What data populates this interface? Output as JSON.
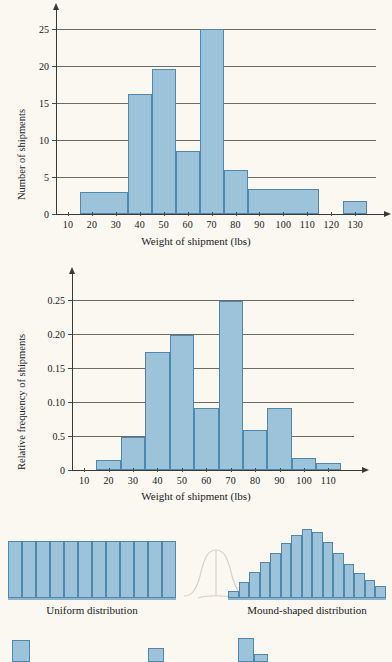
{
  "page": {
    "background_color": "#faf8f1",
    "bar_fill_color": "#9dc3da",
    "bar_stroke_color": "#4e88ac",
    "grid_color": "#6b6b63",
    "axis_color": "#3a3a34"
  },
  "chart_data": [
    {
      "id": "frequency-histogram",
      "type": "bar",
      "title": "",
      "xlabel": "Weight of shipment (lbs)",
      "ylabel": "Number of shipments",
      "xlim": [
        5,
        137
      ],
      "ylim": [
        0,
        26
      ],
      "xticks": [
        10,
        20,
        30,
        40,
        50,
        60,
        70,
        80,
        90,
        100,
        110,
        120,
        130
      ],
      "xtick_labels": [
        "10",
        "20",
        "30",
        "40",
        "50",
        "60",
        "70",
        "80",
        "90",
        "100",
        "110",
        "120",
        "130"
      ],
      "yticks": [
        0,
        5,
        10,
        15,
        20,
        25
      ],
      "ytick_labels": [
        "0",
        "5",
        "10",
        "15",
        "20",
        "25"
      ],
      "grid": "horizontal",
      "legend": "none",
      "bins": [
        {
          "x0": 15,
          "x1": 35,
          "value": 3.0
        },
        {
          "x0": 35,
          "x1": 45,
          "value": 16.3
        },
        {
          "x0": 45,
          "x1": 55,
          "value": 19.6
        },
        {
          "x0": 55,
          "x1": 65,
          "value": 8.5
        },
        {
          "x0": 65,
          "x1": 75,
          "value": 25.0
        },
        {
          "x0": 75,
          "x1": 85,
          "value": 6.0
        },
        {
          "x0": 85,
          "x1": 115,
          "value": 3.4
        },
        {
          "x0": 125,
          "x1": 135,
          "value": 1.8
        }
      ]
    },
    {
      "id": "relative-frequency-histogram",
      "type": "bar",
      "title": "",
      "xlabel": "Weight of shipment (lbs)",
      "ylabel": "Relative frequency of shipments",
      "xlim": [
        5,
        118
      ],
      "ylim": [
        0,
        0.27
      ],
      "xticks": [
        10,
        20,
        30,
        40,
        50,
        60,
        70,
        80,
        90,
        100,
        110
      ],
      "xtick_labels": [
        "10",
        "20",
        "30",
        "40",
        "50",
        "60",
        "70",
        "80",
        "90",
        "100",
        "110"
      ],
      "yticks": [
        0,
        0.05,
        0.1,
        0.15,
        0.2,
        0.25
      ],
      "ytick_labels": [
        "0",
        "0.5",
        "0.10",
        "0.15",
        "0.20",
        "0.25"
      ],
      "grid": "horizontal",
      "legend": "none",
      "bins": [
        {
          "x0": 15,
          "x1": 25,
          "value": 0.015
        },
        {
          "x0": 25,
          "x1": 35,
          "value": 0.048
        },
        {
          "x0": 35,
          "x1": 45,
          "value": 0.173
        },
        {
          "x0": 45,
          "x1": 55,
          "value": 0.198
        },
        {
          "x0": 55,
          "x1": 65,
          "value": 0.091
        },
        {
          "x0": 65,
          "x1": 75,
          "value": 0.248
        },
        {
          "x0": 75,
          "x1": 85,
          "value": 0.058
        },
        {
          "x0": 85,
          "x1": 95,
          "value": 0.091
        },
        {
          "x0": 95,
          "x1": 105,
          "value": 0.018
        },
        {
          "x0": 105,
          "x1": 115,
          "value": 0.01
        }
      ]
    },
    {
      "id": "uniform-distribution-shape",
      "type": "bar",
      "title": "Uniform distribution",
      "xlabel": "",
      "ylabel": "",
      "grid": "none",
      "legend": "none",
      "values": [
        1,
        1,
        1,
        1,
        1,
        1,
        1,
        1,
        1,
        1,
        1,
        1
      ],
      "ylim": [
        0,
        1.12
      ]
    },
    {
      "id": "mound-shaped-distribution-shape",
      "type": "bar",
      "title": "Mound-shaped distribution",
      "xlabel": "",
      "ylabel": "",
      "grid": "none",
      "legend": "none",
      "values": [
        0.1,
        0.24,
        0.38,
        0.52,
        0.66,
        0.8,
        0.92,
        1.0,
        0.97,
        0.82,
        0.66,
        0.5,
        0.36,
        0.26,
        0.18
      ],
      "ylim": [
        0,
        1.08
      ]
    }
  ],
  "figures": {
    "chart1": {
      "xlabel": "Weight of shipment (lbs)",
      "ylabel": "Number of shipments"
    },
    "chart2": {
      "xlabel": "Weight of shipment (lbs)",
      "ylabel": "Relative frequency of shipments"
    },
    "uniform": {
      "caption": "Uniform distribution"
    },
    "mound": {
      "caption": "Mound-shaped distribution"
    }
  }
}
